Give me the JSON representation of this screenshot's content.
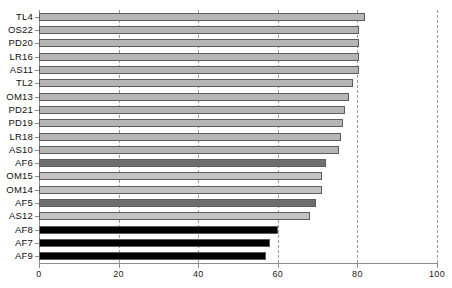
{
  "chart_data": {
    "type": "bar",
    "orientation": "horizontal",
    "title": "",
    "xlabel": "",
    "ylabel": "",
    "xlim": [
      0,
      100
    ],
    "grid": true,
    "legend": "none",
    "xticks": [
      0,
      20,
      40,
      60,
      80,
      100
    ],
    "categories": [
      "TL4",
      "OS22",
      "PD20",
      "LR16",
      "AS11",
      "TL2",
      "OM13",
      "PD21",
      "PD19",
      "LR18",
      "AS10",
      "AF6",
      "OM15",
      "OM14",
      "AF5",
      "AS12",
      "AF8",
      "AF7",
      "AF9"
    ],
    "values": [
      82,
      80.5,
      80.5,
      80.5,
      80.5,
      79,
      78,
      77,
      76.5,
      76,
      75.5,
      72,
      71,
      71,
      69.5,
      68,
      60,
      58,
      57
    ],
    "colors": [
      "#b5b5b5",
      "#b5b5b5",
      "#b5b5b5",
      "#b5b5b5",
      "#b5b5b5",
      "#b5b5b5",
      "#b5b5b5",
      "#b5b5b5",
      "#b5b5b5",
      "#b5b5b5",
      "#b5b5b5",
      "#6e6e6e",
      "#c2c2c2",
      "#c2c2c2",
      "#6e6e6e",
      "#c2c2c2",
      "#000000",
      "#000000",
      "#000000"
    ],
    "bar_edge_color": "#5c5c5c",
    "gridline_color": "#9a9a9a",
    "axis_color": "#8d8d8d"
  }
}
